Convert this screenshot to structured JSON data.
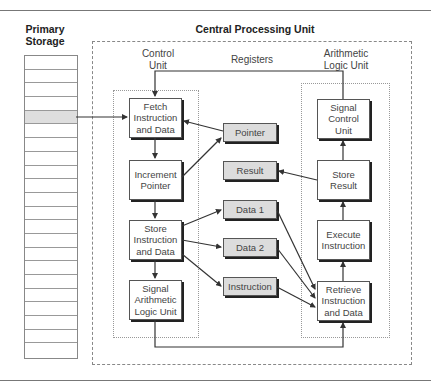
{
  "titles": {
    "primary_storage": "Primary\nStorage",
    "cpu": "Central Processing Unit"
  },
  "sections": {
    "control_unit": "Control\nUnit",
    "registers": "Registers",
    "alu": "Arithmetic\nLogic Unit"
  },
  "storage": {
    "rows": 22,
    "highlighted_row": 5
  },
  "control_steps": [
    {
      "label": "Fetch\nInstruction\nand Data"
    },
    {
      "label": "Increment\nPointer"
    },
    {
      "label": "Store\nInstruction\nand Data"
    },
    {
      "label": "Signal\nArithmetic\nLogic Unit"
    }
  ],
  "registers": [
    {
      "label": "Pointer"
    },
    {
      "label": "Result"
    },
    {
      "label": "Data 1"
    },
    {
      "label": "Data 2"
    },
    {
      "label": "Instruction"
    }
  ],
  "alu_steps": [
    {
      "label": "Signal\nControl\nUnit"
    },
    {
      "label": "Store\nResult"
    },
    {
      "label": "Execute\nInstruction"
    },
    {
      "label": "Retrieve\nInstruction\nand Data"
    }
  ],
  "colors": {
    "register_fill": "#dcdcdc",
    "highlight_row": "#dedede",
    "line": "#333333"
  }
}
